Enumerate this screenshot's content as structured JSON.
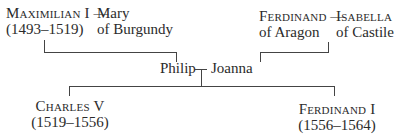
{
  "tree": {
    "generation1_left": {
      "husband": {
        "name": "Maximilian I",
        "dates": "(1493–1519)"
      },
      "connector": "—",
      "wife": {
        "name_line1": "Mary",
        "name_line2": "of Burgundy"
      }
    },
    "generation1_right": {
      "husband": {
        "name": "Ferdinand",
        "name_line2": "of Aragon"
      },
      "connector": "—",
      "wife": {
        "name": "Isabella",
        "name_line2": "of Castile"
      }
    },
    "generation2": {
      "husband": "Philip",
      "connector": "—",
      "wife": "Joanna"
    },
    "generation3": [
      {
        "name": "Charles V",
        "dates": "(1519–1556)"
      },
      {
        "name": "Ferdinand I",
        "dates": "(1556–1564)"
      }
    ]
  }
}
